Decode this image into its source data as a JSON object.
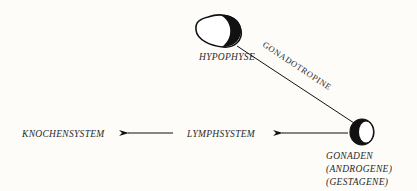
{
  "diagram": {
    "nodes": {
      "hypophyse": {
        "label": "HYPOPHYSE"
      },
      "gonaden": {
        "label_lines": [
          "GONADEN",
          "(ANDROGENE)",
          "(GESTAGENE)"
        ]
      },
      "lymphsystem": {
        "label": "LYMPHSYSTEM"
      },
      "knochensystem": {
        "label": "KNOCHENSYSTEM"
      }
    },
    "edges": [
      {
        "from": "hypophyse",
        "to": "gonaden",
        "label": "GONADOTROPINE",
        "arrow": false
      },
      {
        "from": "gonaden",
        "to": "lymphsystem",
        "label": "",
        "arrow": true
      },
      {
        "from": "lymphsystem",
        "to": "knochensystem",
        "label": "",
        "arrow": true
      }
    ],
    "colors": {
      "ink": "#111111",
      "paper": "#fdfcf8"
    }
  }
}
